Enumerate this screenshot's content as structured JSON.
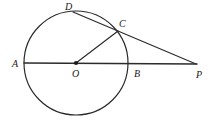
{
  "diagram": {
    "background_color": "#ffffff",
    "stroke_color": "#2b2b2b",
    "label_color": "#1a1a1a",
    "circle": {
      "name": "main-circle",
      "center_label": "O",
      "cx": 76,
      "cy": 63,
      "r": 52,
      "stroke_width": 1.2,
      "fill": "none"
    },
    "points": [
      {
        "id": "A",
        "label": "A",
        "x": 24,
        "y": 63,
        "label_x": 12,
        "label_y": 67,
        "dot": false,
        "on_circle": true
      },
      {
        "id": "D",
        "label": "D",
        "x": 73,
        "y": 12,
        "label_x": 65,
        "label_y": 10,
        "dot": false,
        "on_circle": true
      },
      {
        "id": "C",
        "label": "C",
        "x": 118,
        "y": 31,
        "label_x": 119,
        "label_y": 27,
        "dot": false,
        "on_circle": true
      },
      {
        "id": "O",
        "label": "O",
        "x": 76,
        "y": 63,
        "label_x": 72,
        "label_y": 77,
        "dot": true,
        "on_circle": false
      },
      {
        "id": "B",
        "label": "B",
        "x": 128,
        "y": 63,
        "label_x": 134,
        "label_y": 77,
        "dot": false,
        "on_circle": true
      },
      {
        "id": "P",
        "label": "P",
        "x": 196,
        "y": 64,
        "label_x": 196,
        "label_y": 78,
        "dot": false,
        "on_circle": false
      }
    ],
    "segments": [
      {
        "name": "segment-AP",
        "from": "A",
        "to": "P",
        "x1": 24,
        "y1": 63,
        "x2": 197,
        "y2": 64,
        "stroke_width": 1.4
      },
      {
        "name": "segment-OC",
        "from": "O",
        "to": "C",
        "x1": 76,
        "y1": 63,
        "x2": 118,
        "y2": 31,
        "stroke_width": 1.2
      },
      {
        "name": "segment-DP",
        "from": "D",
        "to": "P",
        "x1": 73,
        "y1": 12,
        "x2": 196,
        "y2": 64,
        "stroke_width": 1.2
      }
    ],
    "center_dot": {
      "name": "center-dot-O",
      "cx": 76,
      "cy": 63,
      "r": 2.1
    }
  }
}
